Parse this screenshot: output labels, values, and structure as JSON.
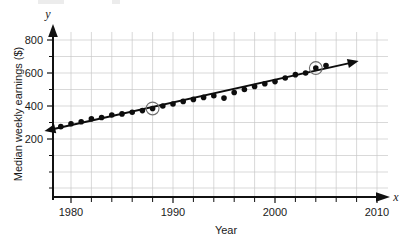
{
  "chart_data": {
    "type": "scatter",
    "title": "",
    "xlabel": "Year",
    "ylabel": "Median weekly earnings ($)",
    "x_axis_variable": "x",
    "y_axis_variable": "y",
    "xlim": [
      1977,
      2011
    ],
    "ylim": [
      0,
      860
    ],
    "xticks": [
      1980,
      1990,
      2000,
      2010
    ],
    "xtick_labels": [
      "1980",
      "1990",
      "2000",
      "2010"
    ],
    "x_minor_step": 2,
    "yticks": [
      200,
      400,
      600,
      800
    ],
    "ytick_labels": [
      "200",
      "400",
      "600",
      "800"
    ],
    "y_minor_step": 100,
    "grid": true,
    "grid_color": "#c8c8c8",
    "legend": "none",
    "point_color": "#0d0d0d",
    "line_color": "#0d0d0d",
    "highlight_ring_color": "#6e6e6e",
    "series": [
      {
        "name": "Median weekly earnings",
        "marker": "filled-circle",
        "points": [
          {
            "x": 1979,
            "y": 275
          },
          {
            "x": 1980,
            "y": 292
          },
          {
            "x": 1981,
            "y": 305
          },
          {
            "x": 1982,
            "y": 322
          },
          {
            "x": 1983,
            "y": 330
          },
          {
            "x": 1984,
            "y": 345
          },
          {
            "x": 1985,
            "y": 352
          },
          {
            "x": 1986,
            "y": 362
          },
          {
            "x": 1987,
            "y": 372
          },
          {
            "x": 1988,
            "y": 385
          },
          {
            "x": 1989,
            "y": 400
          },
          {
            "x": 1990,
            "y": 412
          },
          {
            "x": 1991,
            "y": 428
          },
          {
            "x": 1992,
            "y": 440
          },
          {
            "x": 1993,
            "y": 452
          },
          {
            "x": 1994,
            "y": 462
          },
          {
            "x": 1995,
            "y": 448
          },
          {
            "x": 1996,
            "y": 482
          },
          {
            "x": 1997,
            "y": 500
          },
          {
            "x": 1998,
            "y": 518
          },
          {
            "x": 1999,
            "y": 535
          },
          {
            "x": 2000,
            "y": 548
          },
          {
            "x": 2001,
            "y": 570
          },
          {
            "x": 2002,
            "y": 590
          },
          {
            "x": 2003,
            "y": 600
          },
          {
            "x": 2004,
            "y": 630
          },
          {
            "x": 2005,
            "y": 645
          }
        ]
      }
    ],
    "trend_line": {
      "name": "line of best fit",
      "x_start": 1977.4,
      "y_start": 248,
      "x_end": 2008.2,
      "y_end": 672,
      "arrow_start": true,
      "arrow_end": true
    },
    "highlighted_points": [
      {
        "x": 1988,
        "y": 385,
        "note": "circled data point"
      },
      {
        "x": 2004,
        "y": 630,
        "note": "circled data point"
      }
    ]
  }
}
